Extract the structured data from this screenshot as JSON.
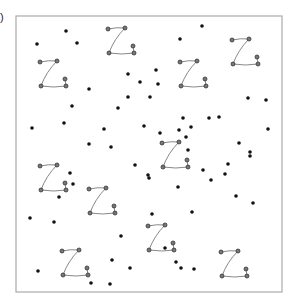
{
  "figure": {
    "panel_label": ")",
    "frame": {
      "x": 16,
      "y": 16,
      "w": 266,
      "h": 276,
      "stroke": "#aaaaaa"
    },
    "dot_color": "#111111",
    "z_color": "#333333",
    "z_line_color": "#888888",
    "z_shapes": [
      {
        "x": 108,
        "y": 29
      },
      {
        "x": 40,
        "y": 62
      },
      {
        "x": 232,
        "y": 40
      },
      {
        "x": 180,
        "y": 62
      },
      {
        "x": 162,
        "y": 143
      },
      {
        "x": 40,
        "y": 166
      },
      {
        "x": 89,
        "y": 189
      },
      {
        "x": 148,
        "y": 226
      },
      {
        "x": 62,
        "y": 251
      },
      {
        "x": 221,
        "y": 252
      },
      {
        "x": 149,
        "y": 226
      }
    ],
    "dots": [
      [
        66,
        31
      ],
      [
        37,
        44
      ],
      [
        77,
        43
      ],
      [
        202,
        26
      ],
      [
        180,
        39
      ],
      [
        128,
        74
      ],
      [
        140,
        82
      ],
      [
        128,
        97
      ],
      [
        158,
        84
      ],
      [
        156,
        70
      ],
      [
        89,
        89
      ],
      [
        150,
        97
      ],
      [
        118,
        108
      ],
      [
        72,
        106
      ],
      [
        32,
        128
      ],
      [
        64,
        123
      ],
      [
        104,
        129
      ],
      [
        111,
        147
      ],
      [
        89,
        144
      ],
      [
        144,
        126
      ],
      [
        160,
        133
      ],
      [
        191,
        127
      ],
      [
        248,
        98
      ],
      [
        209,
        118
      ],
      [
        183,
        118
      ],
      [
        186,
        137
      ],
      [
        219,
        117
      ],
      [
        268,
        129
      ],
      [
        203,
        170
      ],
      [
        228,
        164
      ],
      [
        211,
        180
      ],
      [
        250,
        152
      ],
      [
        266,
        100
      ],
      [
        148,
        175
      ],
      [
        135,
        165
      ],
      [
        73,
        184
      ],
      [
        70,
        173
      ],
      [
        59,
        197
      ],
      [
        30,
        218
      ],
      [
        54,
        222
      ],
      [
        121,
        236
      ],
      [
        112,
        260
      ],
      [
        130,
        268
      ],
      [
        165,
        248
      ],
      [
        181,
        268
      ],
      [
        194,
        269
      ],
      [
        149,
        178
      ],
      [
        179,
        130
      ],
      [
        38,
        271
      ],
      [
        91,
        283
      ],
      [
        110,
        284
      ],
      [
        176,
        262
      ],
      [
        188,
        150
      ],
      [
        239,
        143
      ],
      [
        225,
        174
      ],
      [
        253,
        203
      ],
      [
        152,
        214
      ],
      [
        178,
        187
      ],
      [
        250,
        156
      ],
      [
        236,
        196
      ],
      [
        192,
        212
      ]
    ]
  }
}
